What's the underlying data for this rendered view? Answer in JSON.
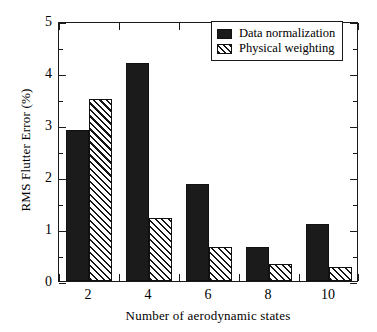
{
  "chart_data": {
    "type": "bar",
    "title": "",
    "xlabel": "Number of aerodynamic states",
    "ylabel": "RMS Flutter Error (%)",
    "categories": [
      "2",
      "4",
      "6",
      "8",
      "10"
    ],
    "series": [
      {
        "name": "Data normalization",
        "fill": "solid",
        "color": "#1b1b1b",
        "values": [
          2.9,
          4.2,
          1.87,
          0.65,
          1.1
        ]
      },
      {
        "name": "Physical weighting",
        "fill": "hatched",
        "color": "#151515",
        "values": [
          3.5,
          1.22,
          0.65,
          0.32,
          0.27
        ]
      }
    ],
    "ylim": [
      0,
      5
    ],
    "ytick_labels": [
      "0",
      "1",
      "2",
      "3",
      "4",
      "5"
    ],
    "ytick_values": [
      0,
      1,
      2,
      3,
      4,
      5
    ],
    "yminor_values": [
      0.5,
      1.5,
      2.5,
      3.5,
      4.5
    ],
    "xtick_labels": [
      "2",
      "4",
      "6",
      "8",
      "10"
    ],
    "grid": false,
    "legend_position": "top-right",
    "frame": true,
    "tick_direction": "in"
  },
  "legend": {
    "entries": [
      {
        "label": "Data normalization",
        "swatch": "solid-square-icon"
      },
      {
        "label": "Physical weighting",
        "swatch": "hatched-square-icon"
      }
    ]
  },
  "axes": {
    "y_title": "RMS Flutter Error (%)",
    "x_title": "Number of aerodynamic states"
  }
}
